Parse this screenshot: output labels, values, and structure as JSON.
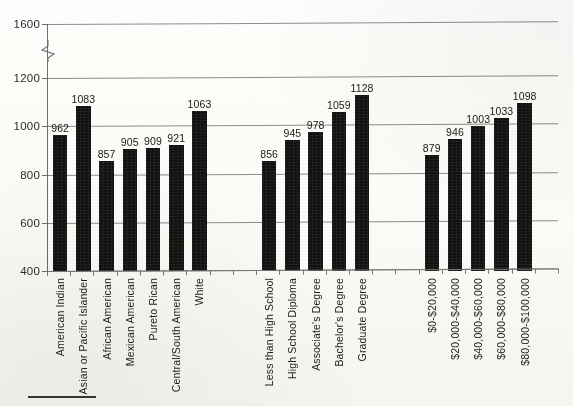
{
  "chart_data": {
    "type": "bar",
    "title": "",
    "subtitle": "",
    "xlabel": "",
    "ylabel": "",
    "ylim": [
      400,
      1600
    ],
    "grid": true,
    "legend": "none",
    "axis_break": {
      "present": true,
      "between": [
        1200,
        1600
      ]
    },
    "y_ticks": [
      400,
      600,
      800,
      1000,
      1200,
      1600
    ],
    "categories": [
      "American Indian",
      "Asian or Pacific Islander",
      "African American",
      "Mexican American",
      "Pureto Rican",
      "Central/South American",
      "White",
      "Less than High School",
      "High School Diploma",
      "Associate's Degree",
      "Bachelor's Degree",
      "Graduate Degree",
      "$0-$20,000",
      "$20,000-$40,000",
      "$40,000-$60,000",
      "$60,000-$80,000",
      "$80,000-$100,000"
    ],
    "values": [
      962,
      1083,
      857,
      905,
      909,
      921,
      1063,
      856,
      945,
      978,
      1059,
      1128,
      879,
      946,
      1003,
      1033,
      1098
    ],
    "groups": [
      {
        "name": "Race/Ethnicity",
        "categories": [
          "American Indian",
          "Asian or Pacific Islander",
          "African American",
          "Mexican American",
          "Pureto Rican",
          "Central/South American",
          "White"
        ],
        "values": [
          962,
          1083,
          857,
          905,
          909,
          921,
          1063
        ]
      },
      {
        "name": "Education",
        "categories": [
          "Less than High School",
          "High School Diploma",
          "Associate's Degree",
          "Bachelor's Degree",
          "Graduate Degree"
        ],
        "values": [
          856,
          945,
          978,
          1059,
          1128
        ]
      },
      {
        "name": "Income",
        "categories": [
          "$0-$20,000",
          "$20,000-$40,000",
          "$40,000-$60,000",
          "$60,000-$80,000",
          "$80,000-$100,000"
        ],
        "values": [
          879,
          946,
          1003,
          1033,
          1098
        ]
      }
    ],
    "bar_color": "#111111",
    "grid_color": "#8d8d8d",
    "axis_color": "#6d6d6d",
    "background": "#fdfdfb"
  }
}
